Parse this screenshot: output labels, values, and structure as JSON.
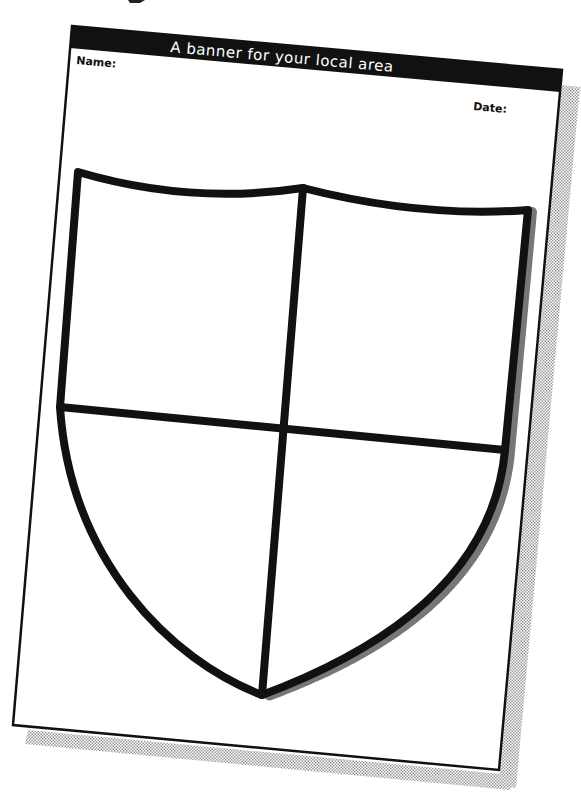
{
  "worksheet": {
    "title": "A banner for your local area",
    "name_label": "Name:",
    "date_label": "Date:"
  },
  "shield": {
    "quadrants": 4,
    "icon": "shield-outline-icon"
  },
  "colors": {
    "ink": "#111111",
    "paper": "#ffffff",
    "shadow": "#bdbdbd"
  }
}
